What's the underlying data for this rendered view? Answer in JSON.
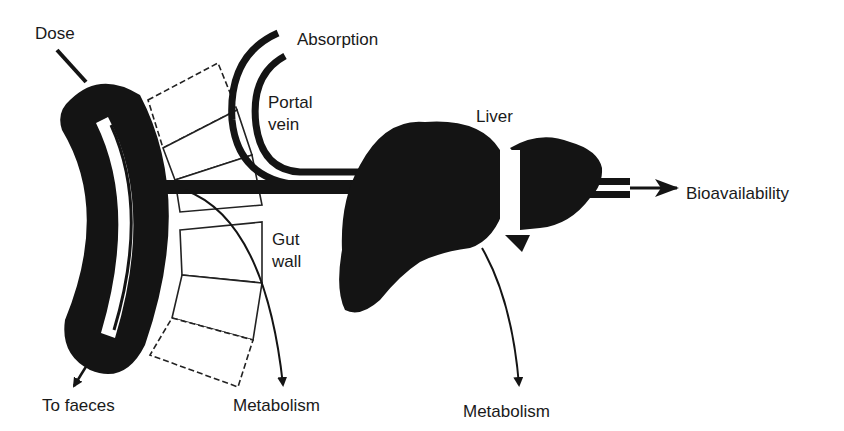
{
  "diagram": {
    "labels": {
      "dose": "Dose",
      "absorption": "Absorption",
      "portal_vein_line1": "Portal",
      "portal_vein_line2": "vein",
      "liver": "Liver",
      "bioavailability": "Bioavailability",
      "gut_wall_line1": "Gut",
      "gut_wall_line2": "wall",
      "to_faeces": "To faeces",
      "metabolism_gut": "Metabolism",
      "metabolism_liver": "Metabolism"
    },
    "colors": {
      "ink": "#141414",
      "background": "#ffffff",
      "text": "#1a1a1a"
    },
    "nodes": [
      "Gut lumen",
      "Gut wall",
      "Portal vein",
      "Liver"
    ],
    "flows": [
      {
        "from": "Dose",
        "to": "Gut lumen"
      },
      {
        "from": "Gut lumen",
        "to": "To faeces"
      },
      {
        "from": "Gut wall",
        "to": "Metabolism"
      },
      {
        "from": "Gut wall",
        "to": "Portal vein",
        "label": "Absorption"
      },
      {
        "from": "Portal vein",
        "to": "Liver"
      },
      {
        "from": "Liver",
        "to": "Metabolism"
      },
      {
        "from": "Liver",
        "to": "Bioavailability"
      }
    ]
  }
}
